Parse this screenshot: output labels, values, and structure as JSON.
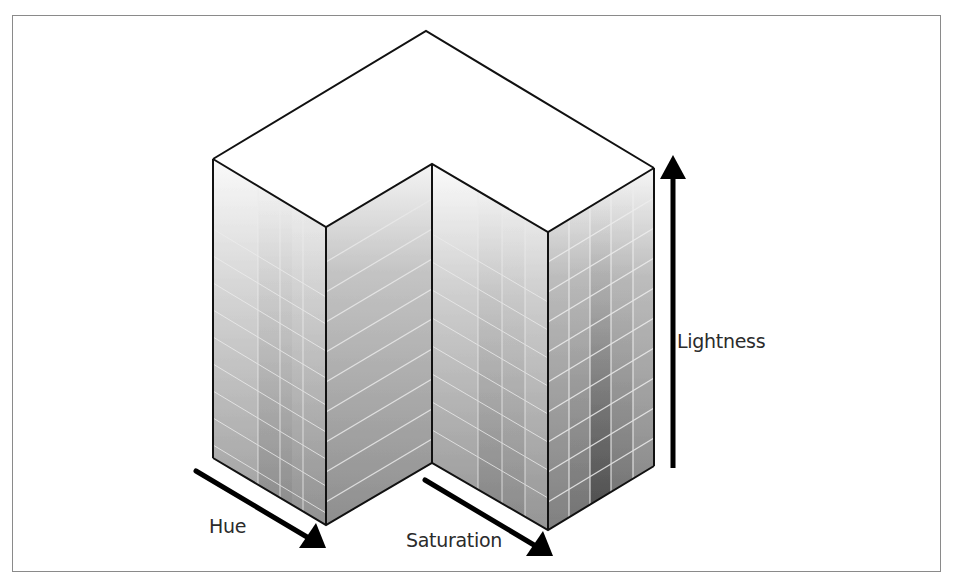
{
  "figure": {
    "axes": {
      "hue": {
        "label": "Hue",
        "direction": "down-right along left front edge"
      },
      "saturation": {
        "label": "Saturation",
        "direction": "down-right along inner front edge"
      },
      "lightness": {
        "label": "Lightness",
        "direction": "up"
      }
    },
    "colors": {
      "background": "#ffffff",
      "frame": "#8a8a8a",
      "edge": "#111111",
      "face_light": "#f7f7f7",
      "face_dark": "#8c8c8c",
      "grid_line": "#e6e6e6",
      "arrow": "#000000",
      "label_text": "#2b2b2b"
    }
  }
}
